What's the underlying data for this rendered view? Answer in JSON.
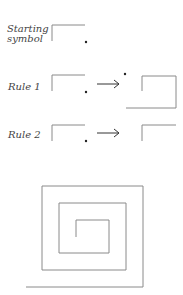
{
  "labels": {
    "starting": "Starting",
    "symbol": "symbol",
    "rule1": "Rule 1",
    "rule2": "Rule 2"
  },
  "arrow": "→",
  "colors": {
    "line": "#8a8a8a",
    "dot": "#222222"
  },
  "spiral_points": "26,287 143,287 143,186 42,186 42,270 126,270 126,203 59,203 59,253 109,253 109,220 76,220 76,237"
}
